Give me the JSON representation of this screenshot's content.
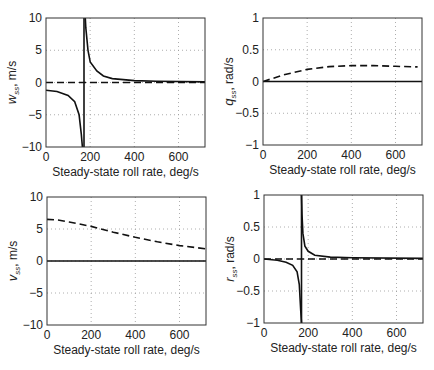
{
  "chart_data": [
    {
      "type": "line",
      "panel": "top-left",
      "ylabel": "w_ss, m/s",
      "ylabel_main": "w",
      "ylabel_sub": "ss",
      "ylabel_unit": ", m/s",
      "xlabel": "Steady-state roll rate, deg/s",
      "xlim": [
        0,
        720
      ],
      "ylim": [
        -10,
        10
      ],
      "xticks": [
        "0",
        "200",
        "400",
        "600"
      ],
      "yticks": [
        "10",
        "5",
        "0",
        "-5",
        "-10"
      ],
      "grid": true,
      "series": [
        {
          "name": "solid",
          "style": "solid",
          "x": [
            0,
            50,
            100,
            130,
            150,
            160,
            165,
            170
          ],
          "y": [
            -1.2,
            -1.4,
            -2.0,
            -3.0,
            -5.0,
            -8.0,
            -10,
            -10
          ]
        },
        {
          "name": "solid-branch2",
          "style": "solid",
          "x": [
            178,
            180,
            190,
            200,
            230,
            260,
            300,
            400,
            500,
            720
          ],
          "y": [
            10,
            8.5,
            5.0,
            3.2,
            1.8,
            1.0,
            0.6,
            0.3,
            0.2,
            0.1
          ]
        },
        {
          "name": "asymptote",
          "style": "solid",
          "x": [
            172,
            172
          ],
          "y": [
            -10,
            10
          ]
        },
        {
          "name": "dashed",
          "style": "dashed",
          "x": [
            0,
            720
          ],
          "y": [
            0,
            0
          ]
        }
      ]
    },
    {
      "type": "line",
      "panel": "top-right",
      "ylabel": "q_ss, rad/s",
      "ylabel_main": "q",
      "ylabel_sub": "ss",
      "ylabel_unit": ", rad/s",
      "xlabel": "Steady-state roll rate, deg/s",
      "xlim": [
        0,
        720
      ],
      "ylim": [
        -1,
        1
      ],
      "xticks": [
        "0",
        "200",
        "400",
        "600"
      ],
      "yticks": [
        "1",
        "0.5",
        "0",
        "-0.5",
        "-1"
      ],
      "grid": true,
      "series": [
        {
          "name": "solid",
          "style": "solid",
          "x": [
            0,
            720
          ],
          "y": [
            0,
            0
          ]
        },
        {
          "name": "dashed",
          "style": "dashed",
          "x": [
            0,
            100,
            200,
            300,
            400,
            500,
            600,
            700
          ],
          "y": [
            0,
            0.11,
            0.19,
            0.235,
            0.25,
            0.25,
            0.24,
            0.23
          ]
        }
      ]
    },
    {
      "type": "line",
      "panel": "bottom-left",
      "ylabel": "v_ss, m/s",
      "ylabel_main": "v",
      "ylabel_sub": "ss",
      "ylabel_unit": ", m/s",
      "xlabel": "Steady-state roll rate, deg/s",
      "xlim": [
        0,
        720
      ],
      "ylim": [
        -10,
        10
      ],
      "xticks": [
        "0",
        "200",
        "400",
        "600"
      ],
      "yticks": [
        "10",
        "5",
        "0",
        "-5",
        "-10"
      ],
      "grid": true,
      "series": [
        {
          "name": "solid",
          "style": "solid",
          "x": [
            0,
            720
          ],
          "y": [
            0,
            0
          ]
        },
        {
          "name": "dashed",
          "style": "dashed",
          "x": [
            0,
            50,
            100,
            200,
            300,
            400,
            500,
            600,
            720
          ],
          "y": [
            6.5,
            6.4,
            6.1,
            5.4,
            4.5,
            3.7,
            3.0,
            2.4,
            1.9
          ]
        }
      ]
    },
    {
      "type": "line",
      "panel": "bottom-right",
      "ylabel": "r_ss, rad/s",
      "ylabel_main": "r",
      "ylabel_sub": "ss",
      "ylabel_unit": ", rad/s",
      "xlabel": "Steady-state roll rate, deg/s",
      "xlim": [
        0,
        720
      ],
      "ylim": [
        -1,
        1
      ],
      "xticks": [
        "0",
        "200",
        "400",
        "600"
      ],
      "yticks": [
        "1",
        "0.5",
        "0",
        "-0.5",
        "-1"
      ],
      "grid": true,
      "series": [
        {
          "name": "solid",
          "style": "solid",
          "x": [
            0,
            60,
            100,
            130,
            150,
            160,
            166,
            170
          ],
          "y": [
            0,
            -0.02,
            -0.05,
            -0.1,
            -0.2,
            -0.4,
            -0.8,
            -1
          ]
        },
        {
          "name": "solid-branch2",
          "style": "solid",
          "x": [
            170,
            172,
            176,
            185,
            200,
            230,
            300,
            400,
            720
          ],
          "y": [
            1,
            0.7,
            0.4,
            0.2,
            0.12,
            0.06,
            0.03,
            0.02,
            0.01
          ]
        },
        {
          "name": "asymptote",
          "style": "solid",
          "x": [
            170,
            170
          ],
          "y": [
            -1,
            1
          ]
        },
        {
          "name": "dashed",
          "style": "dashed",
          "x": [
            0,
            720
          ],
          "y": [
            0,
            0
          ]
        }
      ]
    }
  ]
}
